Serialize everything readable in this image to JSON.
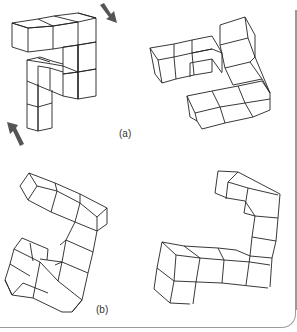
{
  "figure": {
    "panels": [
      {
        "label": "(a)",
        "left_object": "cube-assembly-a-left (with rotation arrows)",
        "right_object": "cube-assembly-a-right",
        "arrows": [
          "rotate-clockwise-arrow-top-right",
          "rotate-arrow-bottom-left"
        ]
      },
      {
        "label": "(b)",
        "left_object": "cube-assembly-b-left",
        "right_object": "cube-assembly-b-right"
      }
    ]
  },
  "colors": {
    "line": "#222222",
    "arrow": "#555555",
    "frame": "#9a9a9a",
    "background": "#ffffff",
    "label": "#333333"
  }
}
